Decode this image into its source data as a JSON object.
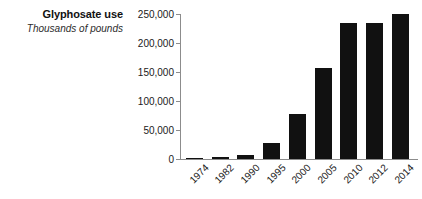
{
  "chart_data": {
    "type": "bar",
    "title": "Glyphosate use",
    "subtitle": "Thousands of pounds",
    "xlabel": "",
    "ylabel": "",
    "categories": [
      "1974",
      "1982",
      "1990",
      "1995",
      "2000",
      "2005",
      "2010",
      "2012",
      "2014"
    ],
    "values": [
      1500,
      4000,
      6500,
      28000,
      78000,
      157000,
      234000,
      234000,
      250000
    ],
    "ylim": [
      0,
      250000
    ],
    "yticks": [
      0,
      50000,
      100000,
      150000,
      200000,
      250000
    ],
    "ytick_labels": [
      "0",
      "50,000",
      "100,000",
      "150,000",
      "200,000",
      "250,000"
    ],
    "grid": false,
    "legend": null,
    "bar_color": "#111111",
    "axis_color": "#8c8c8c",
    "background": "#ffffff"
  },
  "figure": {
    "title": "Glyphosate use",
    "subtitle": "Thousands of pounds"
  }
}
